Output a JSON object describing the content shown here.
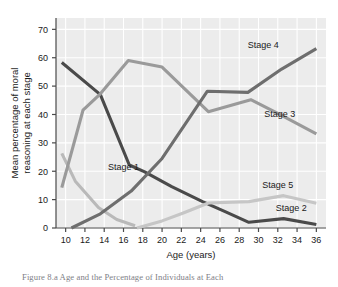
{
  "figure": {
    "caption": "Figure 8.a  Age and the Percentage of Individuals at Each"
  },
  "chart_data": {
    "type": "line",
    "title": "",
    "xlabel": "Age (years)",
    "ylabel": "Mean percentage of moral reasoning at each stage",
    "ylabel_line1": "Mean percentage of moral",
    "ylabel_line2": "reasoning at each stage",
    "x": [
      10,
      12,
      14,
      16,
      18,
      20,
      22,
      24,
      26,
      28,
      30,
      32,
      34,
      36
    ],
    "xlim": [
      9,
      37
    ],
    "ylim": [
      0,
      74
    ],
    "xticks": [
      10,
      12,
      14,
      16,
      18,
      20,
      22,
      24,
      26,
      28,
      30,
      32,
      34,
      36
    ],
    "yticks": [
      0,
      10,
      20,
      30,
      40,
      50,
      60,
      70
    ],
    "grid": true,
    "grid_color": "#ffffff",
    "plot_background": "#ececec",
    "legend": "inline-labels",
    "series": [
      {
        "name": "Stage 1",
        "color": "#b9b9b9",
        "label_x": 16.0,
        "label_y": 20.5,
        "points": [
          [
            9.6,
            26.3
          ],
          [
            11.0,
            16.5
          ],
          [
            13.4,
            7.2
          ],
          [
            15.3,
            3.0
          ],
          [
            17.2,
            0.8
          ]
        ]
      },
      {
        "name": "Stage 2",
        "color": "#4a4a4a",
        "label_x": 33.4,
        "label_y": 6.0,
        "points": [
          [
            9.6,
            58.3
          ],
          [
            13.6,
            47.0
          ],
          [
            16.6,
            22.2
          ],
          [
            18.2,
            19.8
          ],
          [
            21.0,
            14.6
          ],
          [
            24.2,
            9.3
          ],
          [
            26.6,
            5.7
          ],
          [
            29.0,
            2.0
          ],
          [
            32.6,
            3.3
          ],
          [
            36.0,
            1.2
          ]
        ]
      },
      {
        "name": "Stage 3",
        "color": "#9a9a9a",
        "label_x": 32.2,
        "label_y": 39.0,
        "points": [
          [
            9.6,
            14.2
          ],
          [
            11.8,
            41.5
          ],
          [
            13.6,
            47.3
          ],
          [
            16.5,
            59.0
          ],
          [
            20.0,
            56.7
          ],
          [
            24.8,
            41.0
          ],
          [
            29.2,
            45.2
          ],
          [
            32.2,
            40.0
          ],
          [
            36.0,
            33.2
          ]
        ]
      },
      {
        "name": "Stage 4",
        "color": "#6e6e6e",
        "label_x": 30.5,
        "label_y": 63.5,
        "points": [
          [
            10.6,
            0.0
          ],
          [
            13.6,
            5.0
          ],
          [
            16.8,
            13.0
          ],
          [
            20.0,
            24.5
          ],
          [
            24.7,
            48.2
          ],
          [
            28.9,
            47.8
          ],
          [
            32.4,
            56.0
          ],
          [
            36.0,
            63.2
          ]
        ]
      },
      {
        "name": "Stage 5",
        "color": "#c6c6c6",
        "label_x": 32.0,
        "label_y": 14.2,
        "points": [
          [
            17.4,
            0.0
          ],
          [
            20.0,
            2.5
          ],
          [
            22.2,
            5.3
          ],
          [
            24.8,
            8.8
          ],
          [
            29.0,
            9.3
          ],
          [
            32.6,
            11.4
          ],
          [
            36.0,
            8.7
          ]
        ]
      }
    ]
  }
}
